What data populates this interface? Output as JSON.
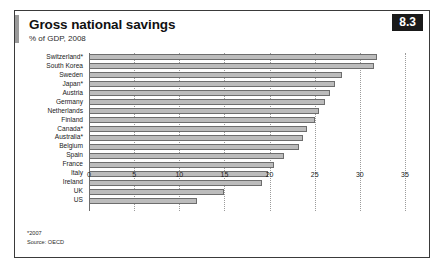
{
  "figure": {
    "badge": "8.3",
    "title": "Gross national savings",
    "subtitle": "% of GDP, 2008",
    "footnotes": [
      "*2007",
      "Source: OECD"
    ],
    "accent_color": "#9a9a9a",
    "bar_fill": "#bcbcbc",
    "bar_stroke": "#6d6d6d",
    "frame_color": "#3a3a3a",
    "badge_bg": "#1a1a1a",
    "badge_fg": "#ffffff"
  },
  "chart_data": {
    "type": "bar",
    "orientation": "horizontal",
    "title": "Gross national savings",
    "subtitle": "% of GDP, 2008",
    "xlabel": "",
    "ylabel": "",
    "xlim": [
      0,
      35
    ],
    "xticks": [
      0,
      5,
      10,
      15,
      20,
      25,
      30,
      35
    ],
    "grid": "vertical-dotted",
    "legend": "none",
    "source": "OECD",
    "categories": [
      "Switzerland*",
      "South Korea",
      "Sweden",
      "Japan*",
      "Austria",
      "Germany",
      "Netherlands",
      "Finland",
      "Canada*",
      "Australia*",
      "Belgium",
      "Spain",
      "France",
      "Italy",
      "Ireland",
      "UK",
      "US"
    ],
    "values": [
      31.9,
      31.6,
      28.0,
      27.3,
      26.7,
      26.1,
      25.5,
      25.0,
      24.2,
      23.7,
      23.3,
      21.6,
      20.5,
      19.8,
      19.2,
      15.0,
      12.0
    ]
  }
}
